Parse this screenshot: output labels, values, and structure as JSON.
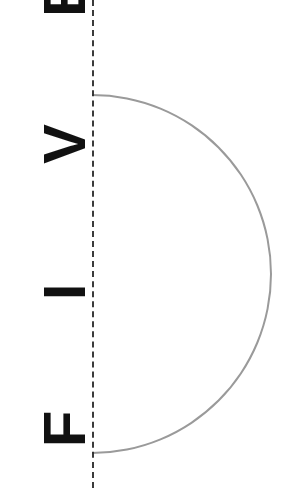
{
  "figure": {
    "title_text": "FIVE",
    "orientation": "rotated-90-ccw",
    "background_color": "#ffffff"
  },
  "axis": {
    "name": "vertical-dashed-axis",
    "style": "dashed",
    "color": "#2b2b2b",
    "x_position": 92,
    "thickness": 2
  },
  "arc": {
    "shape": "semicircular-band",
    "fill_color": "#9a9a9a",
    "opens_toward": "left",
    "top_tip_y": 93,
    "bottom_tip_y": 455,
    "center_y": 274,
    "inner_radius": 136,
    "outer_radius": 176,
    "band_thickness": 40,
    "rightmost_x": 268
  },
  "labels": {
    "letters": [
      {
        "char": "F",
        "order": 1,
        "y_center": 429
      },
      {
        "char": "I",
        "order": 2,
        "y_center": 292
      },
      {
        "char": "V",
        "order": 3,
        "y_center": 144
      },
      {
        "char": "E",
        "order": 4,
        "y_center": -3,
        "clipped": "true"
      }
    ],
    "reading_direction": "bottom-to-top",
    "color": "#111111"
  }
}
